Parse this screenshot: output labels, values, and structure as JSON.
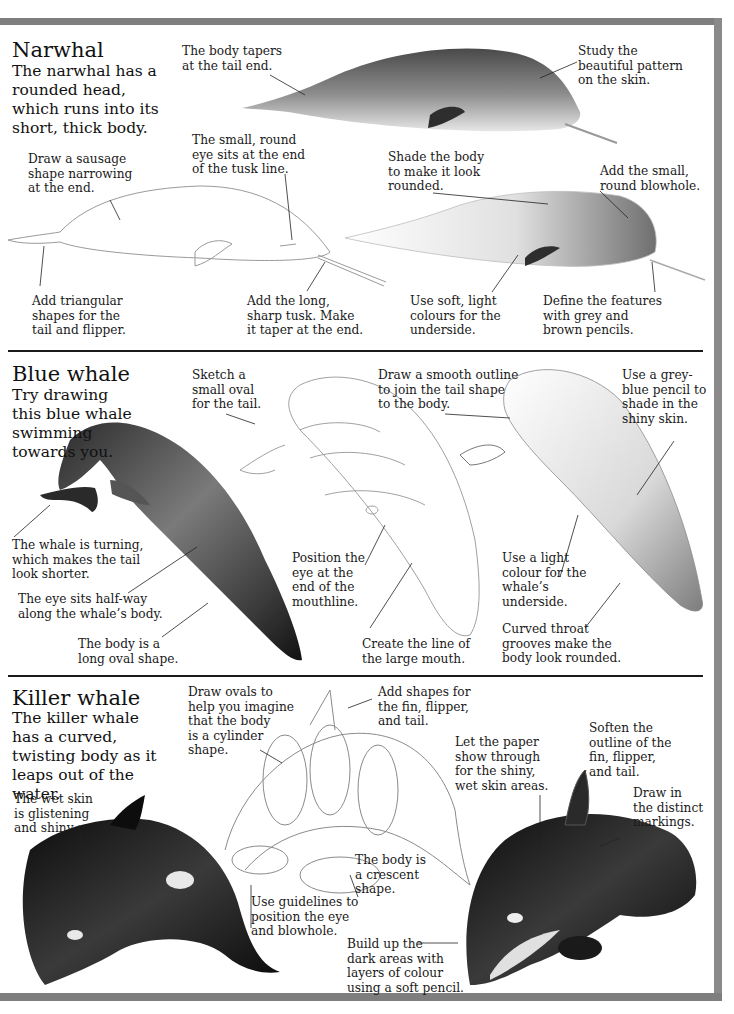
{
  "sections": {
    "narwhal": {
      "title": "Narwhal",
      "intro": "The narwhal has a rounded head, which runs into its short, thick body.",
      "captions": {
        "body_tapers": "The body tapers\nat the tail end.",
        "study_pattern": "Study the\nbeautiful pattern\non the skin.",
        "small_round_eye": "The small, round\neye sits at the end\nof the tusk line.",
        "sausage_shape": "Draw a sausage\nshape narrowing\nat the end.",
        "shade_body": "Shade the body\nto make it look\nrounded.",
        "blowhole": "Add the small,\nround blowhole.",
        "triangular_shapes": "Add triangular\nshapes for the\ntail and flipper.",
        "long_tusk": "Add the long,\nsharp tusk. Make\nit taper at the end.",
        "soft_colours": "Use soft, light\ncolours for the\nunderside.",
        "define_features": "Define the features\nwith grey and\nbrown pencils."
      }
    },
    "blue_whale": {
      "title": "Blue whale",
      "intro": "Try drawing this blue whale swimming towards you.",
      "captions": {
        "sketch_oval": "Sketch a\nsmall oval\nfor the tail.",
        "smooth_outline": "Draw a smooth outline\nto join the tail shape\nto the body.",
        "grey_blue_pencil": "Use a grey-\nblue pencil to\nshade in the\nshiny skin.",
        "whale_turning": "The whale is turning,\nwhich makes the tail\nlook shorter.",
        "eye_halfway": "The eye sits half-way\nalong the whale’s body.",
        "long_oval": "The body is a\nlong oval shape.",
        "position_eye": "Position the\neye at the\nend of the\nmouthline.",
        "large_mouth": "Create the line of\nthe large mouth.",
        "light_colour": "Use a light\ncolour for the\nwhale’s\nunderside.",
        "throat_grooves": "Curved throat\ngrooves make the\nbody look rounded."
      }
    },
    "killer_whale": {
      "title": "Killer whale",
      "intro": "The killer whale has a curved, twisting body as it leaps out of the water.",
      "captions": {
        "draw_ovals": "Draw ovals to\nhelp you imagine\nthat the body\nis a cylinder\nshape.",
        "add_shapes": "Add shapes for\nthe fin, flipper,\nand tail.",
        "soften_outline": "Soften the\noutline of the\nfin, flipper,\nand tail.",
        "paper_show": "Let the paper\nshow through\nfor the shiny,\nwet skin areas.",
        "distinct_markings": "Draw in\nthe distinct\nmarkings.",
        "wet_skin": "The wet skin\nis glistening\nand shiny.",
        "crescent": "The body is\na crescent\nshape.",
        "guidelines": "Use guidelines to\nposition the eye\nand blowhole.",
        "dark_areas": "Build up the\ndark areas with\nlayers of colour\nusing a soft pencil."
      }
    }
  }
}
